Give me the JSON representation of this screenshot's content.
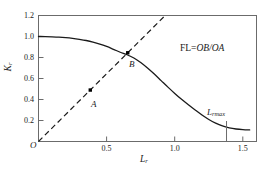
{
  "chart_data": {
    "type": "line",
    "title": "",
    "xlabel": "L_r",
    "ylabel": "K_r",
    "xlim": [
      0,
      1.6
    ],
    "ylim": [
      0,
      1.2
    ],
    "grid": false,
    "legend_position": "none",
    "xticks": [
      0.5,
      1.0,
      1.5
    ],
    "xticklabels": [
      "0.5",
      "1.0",
      "1.5"
    ],
    "yticks": [
      0.2,
      0.4,
      0.6,
      0.8,
      1.0,
      1.2
    ],
    "yticklabels": [
      "0.2",
      "0.4",
      "0.6",
      "0.8",
      "1.0",
      "1.2"
    ],
    "origin_label": "O",
    "series": [
      {
        "name": "failure-assessment-curve",
        "style": "solid",
        "x": [
          0.0,
          0.05,
          0.1,
          0.15,
          0.2,
          0.25,
          0.3,
          0.35,
          0.4,
          0.45,
          0.5,
          0.55,
          0.6,
          0.65,
          0.7,
          0.75,
          0.8,
          0.85,
          0.9,
          0.95,
          1.0,
          1.05,
          1.1,
          1.15,
          1.2,
          1.25,
          1.3,
          1.35,
          1.4,
          1.45,
          1.5,
          1.55
        ],
        "y": [
          1.0,
          0.999,
          0.997,
          0.994,
          0.989,
          0.982,
          0.973,
          0.962,
          0.947,
          0.928,
          0.905,
          0.878,
          0.85,
          0.826,
          0.795,
          0.752,
          0.7,
          0.642,
          0.58,
          0.518,
          0.458,
          0.402,
          0.35,
          0.3,
          0.252,
          0.21,
          0.175,
          0.148,
          0.13,
          0.119,
          0.113,
          0.11
        ]
      },
      {
        "name": "loading-path-line",
        "style": "dashed",
        "x": [
          0.0,
          0.93
        ],
        "y": [
          0.0,
          1.2
        ]
      }
    ],
    "points": [
      {
        "label": "A",
        "x": 0.38,
        "y": 0.49
      },
      {
        "label": "B",
        "x": 0.655,
        "y": 0.845
      }
    ],
    "markers": [
      {
        "name": "lmax-marker",
        "label": "L",
        "sublabel": "rmax",
        "x": 1.38,
        "y_top": 0.195,
        "y_bottom": 0.0
      }
    ],
    "annotations": [
      {
        "name": "fl-definition",
        "prefix": "FL=",
        "italic": "OB/OA",
        "x": 1.05,
        "y": 0.92
      }
    ],
    "colors": {
      "curve": "#1a1a1a",
      "dashed": "#1a1a1a",
      "axis": "#6b6b6b",
      "point": "#000000",
      "background": "#ffffff",
      "text": "#1a1a1a"
    }
  }
}
